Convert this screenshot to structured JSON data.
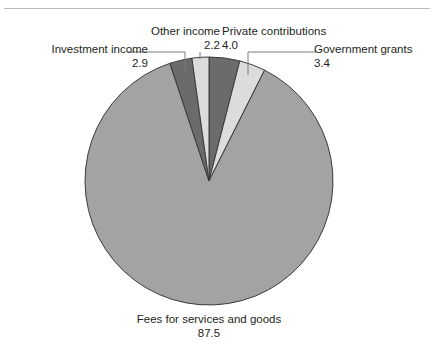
{
  "figure": {
    "background_color": "#ffffff",
    "rule_color": "#b9b9b9",
    "width": 434,
    "height": 358
  },
  "labels": {
    "investment_income": {
      "name": "Investment income",
      "value": "2.9"
    },
    "other_income": {
      "name": "Other income",
      "value": "2.2"
    },
    "private_contributions": {
      "name": "Private contributions",
      "value": "4.0"
    },
    "government_grants": {
      "name": "Government grants",
      "value": "3.4"
    },
    "fees": {
      "name": "Fees for services and goods",
      "value": "87.5"
    }
  },
  "chart_data": {
    "type": "pie",
    "title": "",
    "subtitle": "",
    "xlabel": "",
    "ylabel": "",
    "legend_position": "none",
    "grid": false,
    "units": "percent",
    "total": 100.0,
    "start_angle_deg": 0,
    "direction": "clockwise",
    "center": {
      "x": 209,
      "y": 181
    },
    "radius": 124,
    "categories": [
      "Private contributions",
      "Government grants",
      "Fees for services and goods",
      "Investment income",
      "Other income"
    ],
    "values": [
      4.0,
      3.4,
      87.5,
      2.9,
      2.2
    ],
    "slices": [
      {
        "label": "Private contributions",
        "value": 4.0,
        "value_text": "4.0",
        "color": "#6b6b6b",
        "stroke": "#3b3b3b",
        "start_deg": 0.0,
        "end_deg": 14.4
      },
      {
        "label": "Government grants",
        "value": 3.4,
        "value_text": "3.4",
        "color": "#dcdcdc",
        "stroke": "#3b3b3b",
        "start_deg": 14.4,
        "end_deg": 26.64
      },
      {
        "label": "Fees for services and goods",
        "value": 87.5,
        "value_text": "87.5",
        "color": "#a3a3a3",
        "stroke": "#3b3b3b",
        "start_deg": 26.64,
        "end_deg": 341.64
      },
      {
        "label": "Investment income",
        "value": 2.9,
        "value_text": "2.9",
        "color": "#6b6b6b",
        "stroke": "#3b3b3b",
        "start_deg": 341.64,
        "end_deg": 352.08
      },
      {
        "label": "Other income",
        "value": 2.2,
        "value_text": "2.2",
        "color": "#dcdcdc",
        "stroke": "#3b3b3b",
        "start_deg": 352.08,
        "end_deg": 360.0
      }
    ],
    "leader_lines": [
      {
        "name": "investment-income-leader",
        "color": "#7a7a7a"
      },
      {
        "name": "government-grants-leader",
        "color": "#7a7a7a"
      }
    ]
  }
}
